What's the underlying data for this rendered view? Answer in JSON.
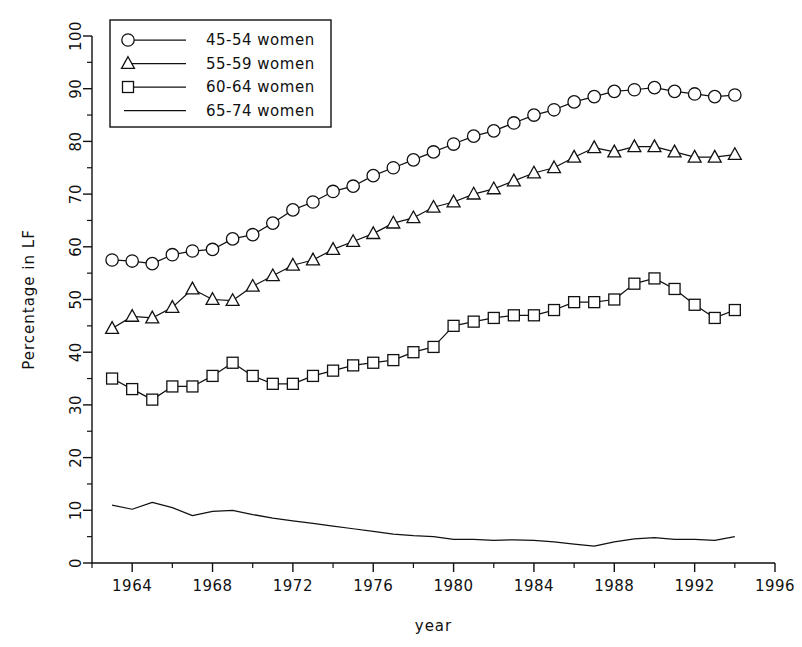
{
  "chart_data": {
    "type": "line",
    "title": "",
    "xlabel": "year",
    "ylabel": "Percentage in LF",
    "xlim": [
      1962,
      1996
    ],
    "ylim": [
      0,
      100
    ],
    "grid": false,
    "legend_position": "top-left",
    "x_ticks": [
      1964,
      1968,
      1972,
      1976,
      1980,
      1984,
      1988,
      1992,
      1996
    ],
    "x_minor_ticks": [
      1962,
      1966,
      1970,
      1974,
      1978,
      1982,
      1986,
      1990,
      1994
    ],
    "y_ticks": [
      0,
      10,
      20,
      30,
      40,
      50,
      60,
      70,
      80,
      90,
      100
    ],
    "y_minor_ticks": [
      5,
      15,
      25,
      35,
      45,
      55,
      65,
      75,
      85,
      95
    ],
    "x": [
      1963,
      1964,
      1965,
      1966,
      1967,
      1968,
      1969,
      1970,
      1971,
      1972,
      1973,
      1974,
      1975,
      1976,
      1977,
      1978,
      1979,
      1980,
      1981,
      1982,
      1983,
      1984,
      1985,
      1986,
      1987,
      1988,
      1989,
      1990,
      1991,
      1992,
      1993,
      1994
    ],
    "series": [
      {
        "name": "45-54 women",
        "marker": "circle",
        "values": [
          57.5,
          57.3,
          56.8,
          58.5,
          59.2,
          59.5,
          61.5,
          62.3,
          64.5,
          67.0,
          68.5,
          70.5,
          71.5,
          73.5,
          75.0,
          76.5,
          78.0,
          79.5,
          81.0,
          82.0,
          83.5,
          85.0,
          86.0,
          87.5,
          88.5,
          89.5,
          89.8,
          90.2,
          89.5,
          89.0,
          88.5,
          88.8
        ]
      },
      {
        "name": "55-59 women",
        "marker": "triangle",
        "values": [
          44.5,
          46.8,
          46.5,
          48.5,
          52.0,
          50.0,
          49.8,
          52.5,
          54.5,
          56.5,
          57.5,
          59.5,
          61.0,
          62.5,
          64.5,
          65.5,
          67.5,
          68.5,
          70.0,
          71.0,
          72.5,
          74.0,
          75.0,
          77.0,
          78.8,
          78.0,
          79.0,
          79.0,
          78.0,
          77.0,
          77.0,
          77.5
        ]
      },
      {
        "name": "60-64 women",
        "marker": "square",
        "values": [
          35.0,
          33.0,
          31.0,
          33.5,
          33.5,
          35.5,
          38.0,
          35.5,
          34.0,
          34.0,
          35.5,
          36.5,
          37.5,
          38.0,
          38.5,
          40.0,
          41.0,
          45.0,
          45.8,
          46.5,
          47.0,
          47.0,
          48.0,
          49.5,
          49.5,
          50.0,
          53.0,
          54.0,
          52.0,
          49.0,
          46.5,
          48.0
        ]
      },
      {
        "name": "65-74 women",
        "marker": "none",
        "values": [
          11.0,
          10.2,
          11.5,
          10.5,
          9.0,
          9.8,
          10.0,
          9.2,
          8.5,
          8.0,
          7.5,
          7.0,
          6.5,
          6.0,
          5.5,
          5.2,
          5.0,
          4.5,
          4.5,
          4.3,
          4.4,
          4.3,
          4.0,
          3.6,
          3.2,
          4.0,
          4.6,
          4.8,
          4.5,
          4.5,
          4.3,
          5.0
        ]
      }
    ],
    "legend_entries": [
      "45-54 women",
      "55-59 women",
      "60-64 women",
      "65-74 women"
    ]
  }
}
